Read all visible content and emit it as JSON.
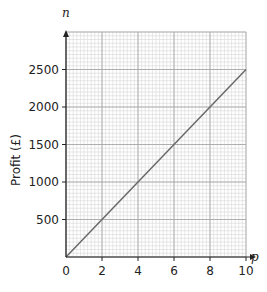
{
  "chart_data": {
    "type": "line",
    "title": "",
    "xlabel": "p",
    "ylabel": "Profit (£)",
    "y_axis_variable": "n",
    "x_axis_variable": "p",
    "xlim": [
      0,
      10
    ],
    "ylim": [
      0,
      3000
    ],
    "x_ticks": [
      0,
      2,
      4,
      6,
      8,
      10
    ],
    "x_tick_labels": [
      "0",
      "2",
      "4",
      "6",
      "8",
      "10"
    ],
    "y_ticks": [
      500,
      1000,
      1500,
      2000,
      2500
    ],
    "y_tick_labels": [
      "500",
      "1000",
      "1500",
      "2000",
      "2500"
    ],
    "grid": true,
    "grid_minor": {
      "x_step": 0.2,
      "y_step": 50
    },
    "grid_major": {
      "x_step": 2,
      "y_step": 500
    },
    "legend": null,
    "series": [
      {
        "name": "Profit",
        "x": [
          0,
          10
        ],
        "values": [
          0,
          2500
        ],
        "color": "#666666"
      }
    ]
  },
  "labels": {
    "y_var": "n",
    "x_var": "p",
    "y_title": "Profit (£)",
    "origin": "0"
  },
  "colors": {
    "axis": "#222222",
    "minor_grid": "#d6d6d6",
    "major_grid": "#a8a8a8",
    "line": "#666666"
  }
}
